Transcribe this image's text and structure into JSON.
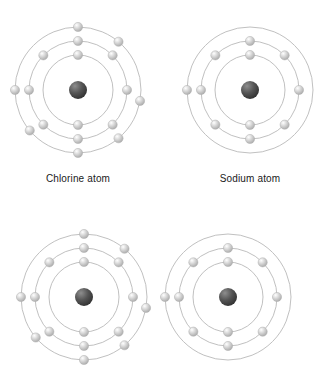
{
  "diagram": {
    "title_visible": false,
    "background_color": "#ffffff",
    "shell_stroke_color": "#b9b9b9",
    "electron_color": "#d8d8d8",
    "electron_edge_color": "#b0b0b0",
    "nucleus_color": "#555555",
    "label_color": "#1a1a1a"
  },
  "atoms": [
    {
      "id": "chlorine-top",
      "name": "Chlorine",
      "label": "Chlorine atom",
      "label_visible": true,
      "center_x": 78,
      "center_y": 90,
      "nucleus_radius": 9,
      "shells": [
        {
          "index": 1,
          "radius": 35,
          "electron_count": 2,
          "angles": [
            270,
            90
          ]
        },
        {
          "index": 2,
          "radius": 49,
          "electron_count": 8,
          "angles": [
            270,
            315,
            0,
            45,
            90,
            135,
            180,
            225
          ]
        },
        {
          "index": 3,
          "radius": 63,
          "electron_count": 7,
          "angles": [
            270,
            310,
            10,
            50,
            90,
            140,
            180
          ]
        }
      ],
      "electron_config": "2, 8, 7",
      "valence_electrons": 7
    },
    {
      "id": "sodium-top",
      "name": "Sodium",
      "label": "Sodium atom",
      "label_visible": true,
      "center_x": 250,
      "center_y": 90,
      "nucleus_radius": 9,
      "shells": [
        {
          "index": 1,
          "radius": 35,
          "electron_count": 2,
          "angles": [
            270,
            90
          ]
        },
        {
          "index": 2,
          "radius": 49,
          "electron_count": 8,
          "angles": [
            270,
            315,
            0,
            45,
            90,
            135,
            180,
            225
          ]
        },
        {
          "index": 3,
          "radius": 63,
          "electron_count": 1,
          "angles": [
            180
          ]
        }
      ],
      "electron_config": "2, 8, 1",
      "valence_electrons": 1
    },
    {
      "id": "chlorine-bottom",
      "name": "Chlorine",
      "label": "",
      "label_visible": false,
      "center_x": 84,
      "center_y": 297,
      "nucleus_radius": 9,
      "shells": [
        {
          "index": 1,
          "radius": 35,
          "electron_count": 2,
          "angles": [
            270,
            90
          ]
        },
        {
          "index": 2,
          "radius": 49,
          "electron_count": 8,
          "angles": [
            270,
            315,
            0,
            45,
            90,
            135,
            180,
            225
          ]
        },
        {
          "index": 3,
          "radius": 63,
          "electron_count": 7,
          "angles": [
            270,
            310,
            10,
            50,
            90,
            140,
            180
          ]
        }
      ],
      "electron_config": "2, 8, 7",
      "valence_electrons": 7
    },
    {
      "id": "sodium-bottom",
      "name": "Sodium",
      "label": "",
      "label_visible": false,
      "center_x": 228,
      "center_y": 297,
      "nucleus_radius": 9,
      "shells": [
        {
          "index": 1,
          "radius": 35,
          "electron_count": 2,
          "angles": [
            270,
            90
          ]
        },
        {
          "index": 2,
          "radius": 49,
          "electron_count": 8,
          "angles": [
            270,
            315,
            0,
            45,
            90,
            135,
            180,
            225
          ]
        },
        {
          "index": 3,
          "radius": 63,
          "electron_count": 1,
          "angles": [
            180
          ]
        }
      ],
      "electron_config": "2, 8, 1",
      "valence_electrons": 1
    }
  ],
  "labels": [
    {
      "text": "Chlorine atom",
      "x": 78,
      "y": 173
    },
    {
      "text": "Sodium atom",
      "x": 250,
      "y": 173
    }
  ]
}
